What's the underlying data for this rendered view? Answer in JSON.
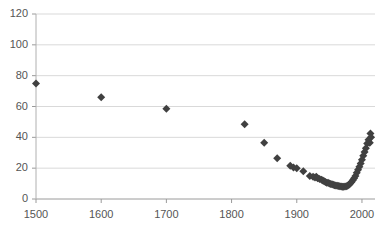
{
  "chart_data": {
    "type": "scatter",
    "title": "",
    "subtitle": "",
    "xlabel": "",
    "ylabel": "",
    "xlim": [
      1500,
      2020
    ],
    "ylim": [
      0,
      120
    ],
    "xticks": [
      1500,
      1600,
      1700,
      1800,
      1900,
      2000
    ],
    "yticks": [
      0,
      20,
      40,
      60,
      80,
      100,
      120
    ],
    "xtick_labels": [
      "1500",
      "1600",
      "1700",
      "1800",
      "1900",
      "2000"
    ],
    "ytick_labels": [
      "0",
      "20",
      "40",
      "60",
      "80",
      "100",
      "120"
    ],
    "grid": "horizontal",
    "legend": "none",
    "marker": "diamond",
    "marker_color": "#404040",
    "marker_size": 4,
    "series": [
      {
        "name": "series-1",
        "points": [
          [
            1500,
            75.0
          ],
          [
            1600,
            66.0
          ],
          [
            1700,
            58.5
          ],
          [
            1820,
            48.5
          ],
          [
            1850,
            36.5
          ],
          [
            1870,
            26.5
          ],
          [
            1890,
            21.5
          ],
          [
            1895,
            20.5
          ],
          [
            1900,
            20.0
          ],
          [
            1910,
            18.0
          ],
          [
            1920,
            15.0
          ],
          [
            1925,
            14.5
          ],
          [
            1928,
            14.0
          ],
          [
            1930,
            14.5
          ],
          [
            1932,
            13.5
          ],
          [
            1935,
            13.0
          ],
          [
            1938,
            12.5
          ],
          [
            1940,
            12.0
          ],
          [
            1942,
            11.5
          ],
          [
            1944,
            11.0
          ],
          [
            1946,
            10.5
          ],
          [
            1948,
            10.5
          ],
          [
            1950,
            10.0
          ],
          [
            1952,
            9.8
          ],
          [
            1954,
            9.5
          ],
          [
            1956,
            9.3
          ],
          [
            1958,
            9.0
          ],
          [
            1960,
            8.8
          ],
          [
            1962,
            8.6
          ],
          [
            1964,
            8.4
          ],
          [
            1966,
            8.2
          ],
          [
            1968,
            8.1
          ],
          [
            1970,
            8.0
          ],
          [
            1972,
            8.0
          ],
          [
            1974,
            8.1
          ],
          [
            1976,
            8.3
          ],
          [
            1978,
            8.6
          ],
          [
            1980,
            9.2
          ],
          [
            1982,
            10.0
          ],
          [
            1984,
            11.0
          ],
          [
            1986,
            12.2
          ],
          [
            1988,
            13.5
          ],
          [
            1990,
            15.0
          ],
          [
            1992,
            17.0
          ],
          [
            1994,
            19.0
          ],
          [
            1996,
            21.0
          ],
          [
            1998,
            23.0
          ],
          [
            2000,
            25.5
          ],
          [
            2002,
            28.0
          ],
          [
            2004,
            30.5
          ],
          [
            2006,
            33.0
          ],
          [
            2008,
            36.0
          ],
          [
            2010,
            38.5
          ],
          [
            2012,
            36.5
          ],
          [
            2013,
            42.5
          ],
          [
            2014,
            40.0
          ]
        ]
      }
    ]
  },
  "axes": {
    "y_min_label": "0",
    "y_max_label": "120"
  }
}
